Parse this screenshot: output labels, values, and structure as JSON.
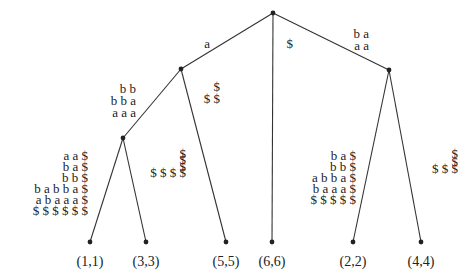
{
  "diagram": {
    "type": "suffix-tree",
    "nodes": [
      {
        "id": "root"
      },
      {
        "id": "n_a"
      },
      {
        "id": "n_aa"
      },
      {
        "id": "n_baa"
      },
      {
        "id": "leaf_1",
        "label": "(1,1)"
      },
      {
        "id": "leaf_3",
        "label": "(3,3)"
      },
      {
        "id": "leaf_5",
        "label": "(5,5)"
      },
      {
        "id": "leaf_6",
        "label": "(6,6)"
      },
      {
        "id": "leaf_2",
        "label": "(2,2)"
      },
      {
        "id": "leaf_4",
        "label": "(4,4)"
      }
    ],
    "edges": [
      {
        "from": "root",
        "to": "n_a",
        "label_rows": [
          "a"
        ]
      },
      {
        "from": "root",
        "to": "leaf_6",
        "label_rows": [
          "$"
        ]
      },
      {
        "from": "root",
        "to": "n_baa",
        "label_rows": [
          "b a",
          "a a"
        ]
      },
      {
        "from": "n_a",
        "to": "n_aa",
        "label_rows": [
          "b b",
          "b b a",
          "a a a"
        ]
      },
      {
        "from": "n_a",
        "to": "leaf_5",
        "label_rows": [
          "$",
          "$ $"
        ]
      },
      {
        "from": "n_aa",
        "to": "leaf_1",
        "label_rows": [
          "a a $",
          "b a $",
          "b b $",
          "b a b b a $",
          "a b a a a $",
          "$ $ $ $ $ $"
        ]
      },
      {
        "from": "n_aa",
        "to": "leaf_3",
        "label_rows": [
          "$",
          "$",
          "$",
          "$ $ $ $"
        ]
      },
      {
        "from": "n_baa",
        "to": "leaf_2",
        "label_rows": [
          "b a $",
          "b b $",
          "a b b a $",
          "b a a a $",
          "$ $ $ $ $"
        ]
      },
      {
        "from": "n_baa",
        "to": "leaf_4",
        "label_rows": [
          "$",
          "$",
          "$ $ $"
        ]
      }
    ]
  }
}
